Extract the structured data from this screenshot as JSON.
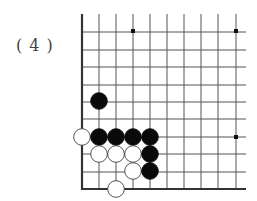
{
  "problem_label": "( 4 )",
  "board": {
    "columns_x": [
      82,
      99,
      116,
      133,
      150,
      167,
      184,
      201,
      218,
      236
    ],
    "rows_y": [
      31,
      48,
      65,
      82,
      99,
      116,
      133,
      150,
      167,
      184
    ],
    "left_edge_x": 82,
    "bottom_edge_y": 189,
    "top_y": 14,
    "right_x": 246,
    "line_color": "#555555",
    "edge_color": "#333333",
    "star_points": [
      [
        133,
        31
      ],
      [
        236,
        31
      ],
      [
        236,
        137
      ]
    ]
  },
  "stones": [
    {
      "color": "black",
      "x": 99,
      "y": 101
    },
    {
      "color": "white",
      "x": 82,
      "y": 137
    },
    {
      "color": "black",
      "x": 99,
      "y": 137
    },
    {
      "color": "black",
      "x": 116,
      "y": 137
    },
    {
      "color": "black",
      "x": 133,
      "y": 137
    },
    {
      "color": "black",
      "x": 150,
      "y": 137
    },
    {
      "color": "white",
      "x": 99,
      "y": 154
    },
    {
      "color": "white",
      "x": 116,
      "y": 154
    },
    {
      "color": "white",
      "x": 133,
      "y": 154
    },
    {
      "color": "black",
      "x": 150,
      "y": 154
    },
    {
      "color": "white",
      "x": 133,
      "y": 171
    },
    {
      "color": "black",
      "x": 150,
      "y": 171
    },
    {
      "color": "white",
      "x": 116,
      "y": 189
    }
  ]
}
